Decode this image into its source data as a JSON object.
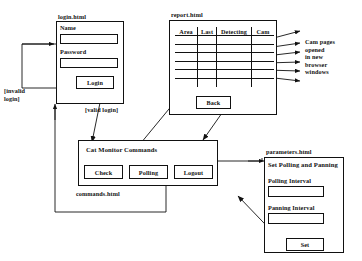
{
  "diagram": {
    "stroke_color": "#111111",
    "background_color": "#ffffff"
  },
  "pages": {
    "login": {
      "label": "login.html",
      "fields": [
        {
          "label": "Name",
          "value": "",
          "placeholder": ""
        },
        {
          "label": "Password",
          "value": "",
          "placeholder": ""
        }
      ],
      "button": "Login"
    },
    "report": {
      "label": "report.html",
      "columns": [
        "Area",
        "Last",
        "Detecting",
        "Cam"
      ],
      "rows": [
        [
          "",
          "",
          "",
          ""
        ],
        [
          "",
          "",
          "",
          ""
        ],
        [
          "",
          "",
          "",
          ""
        ],
        [
          "",
          "",
          "",
          ""
        ],
        [
          "",
          "",
          "",
          ""
        ],
        [
          "",
          "",
          "",
          ""
        ]
      ],
      "button": "Back"
    },
    "commands": {
      "title": "Cat Monitor Commands",
      "label": "commands.html",
      "buttons": [
        "Check",
        "Polling",
        "Logout"
      ]
    },
    "parameters": {
      "label": "parameters.html",
      "title": "Set Polling and Panning",
      "fields": [
        {
          "label": "Polling Interval",
          "value": "",
          "placeholder": ""
        },
        {
          "label": "Panning Interval",
          "value": "",
          "placeholder": ""
        }
      ],
      "button": "Set"
    }
  },
  "edge_labels": {
    "invalid_login": "[invalid\nlogin]",
    "invalid_login_line1": "[invalid",
    "invalid_login_line2": "login]",
    "valid_login": "[valid login]"
  },
  "notes": {
    "cam_pages": [
      "Cam pages",
      "opened",
      "in new",
      "browser",
      "windows"
    ]
  }
}
